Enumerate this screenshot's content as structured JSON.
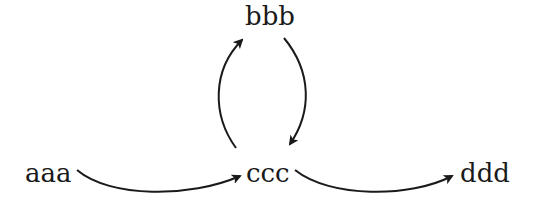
{
  "diagram": {
    "type": "directed-graph",
    "nodes": [
      {
        "id": "aaa",
        "label": "aaa"
      },
      {
        "id": "bbb",
        "label": "bbb"
      },
      {
        "id": "ccc",
        "label": "ccc"
      },
      {
        "id": "ddd",
        "label": "ddd"
      }
    ],
    "edges": [
      {
        "from": "aaa",
        "to": "ccc"
      },
      {
        "from": "ccc",
        "to": "bbb"
      },
      {
        "from": "bbb",
        "to": "ccc"
      },
      {
        "from": "ccc",
        "to": "ddd"
      }
    ],
    "colors": {
      "background": "#ffffff",
      "stroke": "#1a1a1a",
      "text": "#1a1a1a"
    }
  }
}
